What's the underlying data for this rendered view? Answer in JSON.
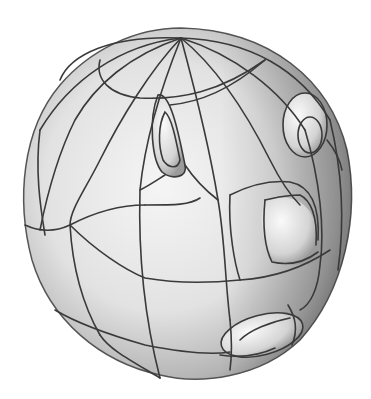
{
  "figure": {
    "colors": {
      "background": "#ffffff",
      "surface_light": "#f2f2f2",
      "surface_mid": "#c8c8c8",
      "surface_dark": "#7a7a7a",
      "curve": "#3a3a3a"
    },
    "pole": {
      "x": 181,
      "y": 38
    },
    "bumps": [
      {
        "name": "upper-left-spike",
        "x": 162,
        "y": 130
      },
      {
        "name": "upper-right-bump",
        "x": 305,
        "y": 120
      },
      {
        "name": "center-right-bump",
        "x": 290,
        "y": 230
      },
      {
        "name": "lower-right-bump",
        "x": 265,
        "y": 335
      }
    ]
  }
}
